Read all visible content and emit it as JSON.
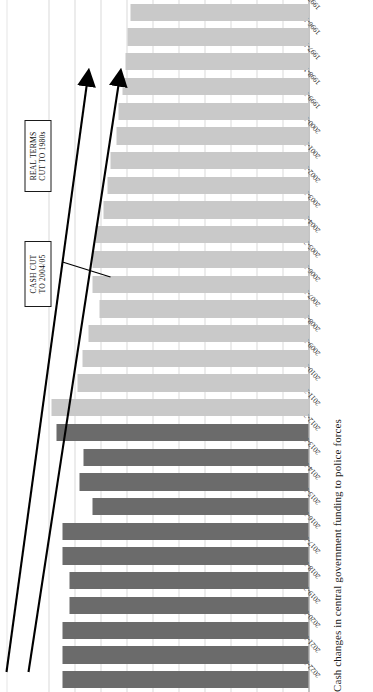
{
  "chart_data": {
    "type": "bar",
    "orientation": "horizontal",
    "title": "Cash changes in central government funding to police forces",
    "xlabel": "",
    "ylabel": "",
    "xlim": [
      0,
      10000
    ],
    "xticks": [
      "10,000",
      "9,000",
      "8,000",
      "7,000",
      "6,000",
      "5,000",
      "4,000",
      "3,000",
      "2,000",
      "1,000",
      "0"
    ],
    "xtick_values": [
      10000,
      9000,
      8000,
      7000,
      6000,
      5000,
      4000,
      3000,
      2000,
      1000,
      0
    ],
    "axis_reversed": true,
    "grid": true,
    "legend": "none",
    "categories": [
      "2022-2023",
      "2021-2022",
      "2020-2021",
      "2019-2020",
      "2018-2019",
      "2017-2018",
      "2016-2017",
      "2015-2016",
      "2014-2015",
      "2013-2014",
      "2012-2013",
      "2011-2012",
      "2010-2011",
      "2009-2010",
      "2008-2009",
      "2007-2008",
      "2006-2007",
      "2005-2006",
      "2004-2005",
      "2003-2004",
      "2002-2003",
      "2001-2002",
      "2000-2001",
      "1999-2000",
      "1998-1999",
      "1997-1998",
      "1996-1997",
      "1995-1996"
    ],
    "values": [
      9450,
      9450,
      9450,
      9200,
      9200,
      9450,
      9450,
      8300,
      8800,
      8650,
      9700,
      9900,
      8900,
      8700,
      8450,
      8050,
      8300,
      8300,
      8200,
      7900,
      7750,
      7600,
      7400,
      7300,
      7150,
      7050,
      6950,
      6850
    ],
    "series_groups": [
      {
        "name": "2012-13 onwards",
        "color": "#6b6b6b",
        "from": "2012-2013",
        "to": "2022-2023"
      },
      {
        "name": "1995-96 to 2011-12",
        "color": "#c9c9c9",
        "from": "1995-1996",
        "to": "2011-2012"
      }
    ],
    "annotations": [
      {
        "id": "cash-cut",
        "text": "CASH CUT\nTO 2004/05",
        "target_category": "2004-2005"
      },
      {
        "id": "real-terms-cut",
        "text": "REAL TERMS\nCUT TO 1980s",
        "target_value": 4700
      }
    ]
  },
  "callouts": {
    "cash_cut": "CASH CUT\nTO 2004/05",
    "real_terms": "REAL TERMS\nCUT TO 1980s"
  }
}
